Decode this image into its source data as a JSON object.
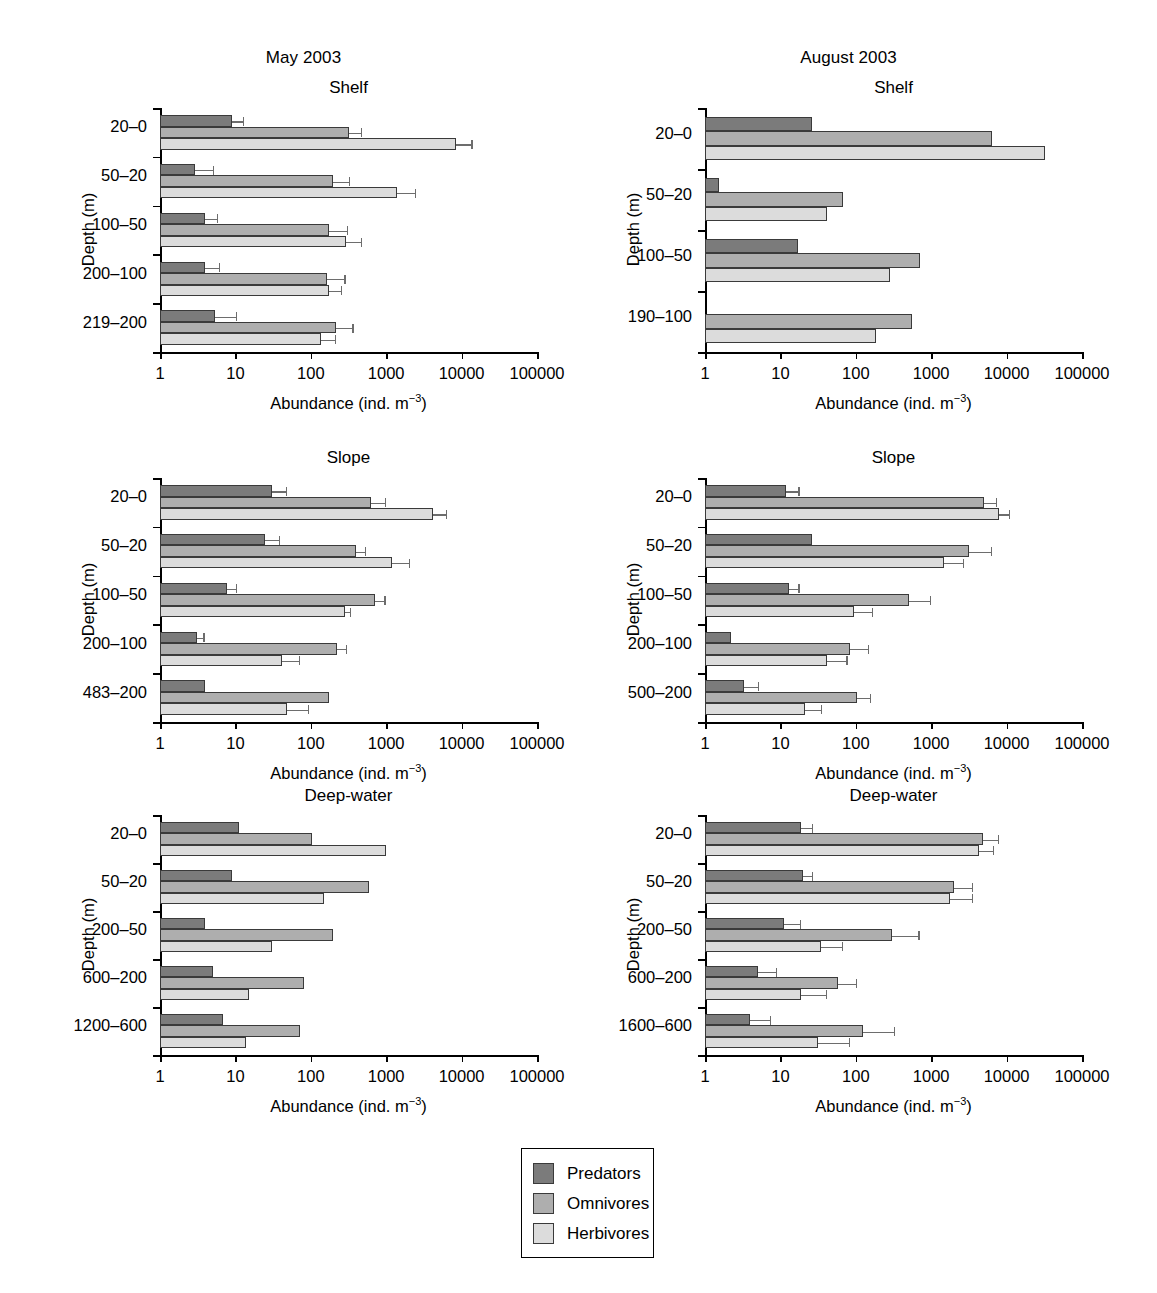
{
  "figure": {
    "columns": [
      {
        "id": "may",
        "title": "May 2003"
      },
      {
        "id": "august",
        "title": "August 2003"
      }
    ],
    "axis_title_x": "Abundance (ind. m",
    "axis_title_x_sup": "−3",
    "axis_title_x_close": ")",
    "axis_title_y": "Depth (m)",
    "xticks": [
      "1",
      "10",
      "100",
      "1000",
      "10000",
      "100000"
    ]
  },
  "legend": {
    "position": "bottom-center",
    "items": [
      {
        "label": "Predators",
        "color": "#7b7b7b"
      },
      {
        "label": "Omnivores",
        "color": "#aeaeae"
      },
      {
        "label": "Herbivores",
        "color": "#dcdcdc"
      }
    ]
  },
  "colors": {
    "predators": "#7b7b7b",
    "omnivores": "#aeaeae",
    "herbivores": "#dcdcdc",
    "axis": "#000000",
    "error": "#6d6d6d"
  },
  "chart_data": [
    {
      "id": "may-shelf",
      "type": "bar",
      "orientation": "horizontal",
      "title": "Shelf",
      "column": "May 2003",
      "xlabel": "Abundance (ind. m-3)",
      "ylabel": "Depth (m)",
      "xscale": "log",
      "xlim": [
        1,
        100000
      ],
      "xticks": [
        1,
        10,
        100,
        1000,
        10000,
        100000
      ],
      "grid": false,
      "categories": [
        "20–0",
        "50–20",
        "100–50",
        "200–100",
        "219–200"
      ],
      "series": [
        {
          "name": "Predators",
          "values": [
            9,
            2.9,
            3.9,
            3.9,
            5.4
          ],
          "errors_upper": [
            13,
            5.2,
            5.9,
            6.2,
            10.5
          ]
        },
        {
          "name": "Omnivores",
          "values": [
            320,
            200,
            175,
            165,
            215
          ],
          "errors_upper": [
            480,
            330,
            310,
            290,
            370
          ]
        },
        {
          "name": "Herbivores",
          "values": [
            8500,
            1400,
            290,
            175,
            135
          ],
          "errors_upper": [
            14000,
            2500,
            480,
            260,
            215
          ]
        }
      ]
    },
    {
      "id": "august-shelf",
      "type": "bar",
      "orientation": "horizontal",
      "title": "Shelf",
      "column": "August 2003",
      "xlabel": "Abundance (ind. m-3)",
      "ylabel": "Depth (m)",
      "xscale": "log",
      "xlim": [
        1,
        100000
      ],
      "xticks": [
        1,
        10,
        100,
        1000,
        10000,
        100000
      ],
      "grid": false,
      "categories": [
        "20–0",
        "50–20",
        "100–50",
        "190–100"
      ],
      "series": [
        {
          "name": "Predators",
          "values": [
            26,
            1.55,
            17,
            0
          ],
          "errors_upper": [
            0,
            0,
            0,
            0
          ]
        },
        {
          "name": "Omnivores",
          "values": [
            6500,
            68,
            720,
            560
          ],
          "errors_upper": [
            0,
            0,
            0,
            0
          ]
        },
        {
          "name": "Herbivores",
          "values": [
            32000,
            42,
            280,
            185
          ],
          "errors_upper": [
            0,
            0,
            0,
            0
          ]
        }
      ]
    },
    {
      "id": "may-slope",
      "type": "bar",
      "orientation": "horizontal",
      "title": "Slope",
      "column": "May 2003",
      "xlabel": "Abundance (ind. m-3)",
      "ylabel": "Depth (m)",
      "xscale": "log",
      "xlim": [
        1,
        100000
      ],
      "xticks": [
        1,
        10,
        100,
        1000,
        10000,
        100000
      ],
      "grid": false,
      "categories": [
        "20–0",
        "50–20",
        "100–50",
        "200–100",
        "483–200"
      ],
      "series": [
        {
          "name": "Predators",
          "values": [
            31,
            25,
            7.8,
            3.1,
            4.0
          ],
          "errors_upper": [
            48,
            39,
            10.5,
            3.9,
            0
          ]
        },
        {
          "name": "Omnivores",
          "values": [
            620,
            400,
            700,
            220,
            175
          ],
          "errors_upper": [
            1000,
            540,
            980,
            300,
            0
          ]
        },
        {
          "name": "Herbivores",
          "values": [
            4200,
            1200,
            280,
            42,
            48
          ],
          "errors_upper": [
            6500,
            2100,
            340,
            72,
            95
          ]
        }
      ]
    },
    {
      "id": "august-slope",
      "type": "bar",
      "orientation": "horizontal",
      "title": "Slope",
      "column": "August 2003",
      "xlabel": "Abundance (ind. m-3)",
      "ylabel": "Depth (m)",
      "xscale": "log",
      "xlim": [
        1,
        100000
      ],
      "xticks": [
        1,
        10,
        100,
        1000,
        10000,
        100000
      ],
      "grid": false,
      "categories": [
        "20–0",
        "50–20",
        "100–50",
        "200–100",
        "500–200"
      ],
      "series": [
        {
          "name": "Predators",
          "values": [
            12,
            26,
            13,
            2.2,
            3.3
          ],
          "errors_upper": [
            18,
            0,
            18,
            0,
            5.2
          ]
        },
        {
          "name": "Omnivores",
          "values": [
            5000,
            3200,
            500,
            85,
            105
          ],
          "errors_upper": [
            7500,
            6500,
            1000,
            150,
            160
          ]
        },
        {
          "name": "Herbivores",
          "values": [
            8000,
            1500,
            95,
            42,
            21
          ],
          "errors_upper": [
            11000,
            2700,
            170,
            78,
            36
          ]
        }
      ]
    },
    {
      "id": "may-deepwater",
      "type": "bar",
      "orientation": "horizontal",
      "title": "Deep-water",
      "column": "May 2003",
      "xlabel": "Abundance (ind. m-3)",
      "ylabel": "Depth (m)",
      "xscale": "log",
      "xlim": [
        1,
        100000
      ],
      "xticks": [
        1,
        10,
        100,
        1000,
        10000,
        100000
      ],
      "grid": false,
      "categories": [
        "20–0",
        "50–20",
        "200–50",
        "600–200",
        "1200–600"
      ],
      "series": [
        {
          "name": "Predators",
          "values": [
            11,
            9.0,
            4.0,
            5.1,
            6.8
          ],
          "errors_upper": [
            0,
            0,
            0,
            0,
            0
          ]
        },
        {
          "name": "Omnivores",
          "values": [
            105,
            600,
            195,
            82,
            72
          ],
          "errors_upper": [
            0,
            0,
            0,
            0,
            0
          ]
        },
        {
          "name": "Herbivores",
          "values": [
            1000,
            150,
            31,
            15,
            14
          ],
          "errors_upper": [
            0,
            0,
            0,
            0,
            0
          ]
        }
      ]
    },
    {
      "id": "august-deepwater",
      "type": "bar",
      "orientation": "horizontal",
      "title": "Deep-water",
      "column": "August 2003",
      "xlabel": "Abundance (ind. m-3)",
      "ylabel": "Depth (m)",
      "xscale": "log",
      "xlim": [
        1,
        100000
      ],
      "xticks": [
        1,
        10,
        100,
        1000,
        10000,
        100000
      ],
      "grid": false,
      "categories": [
        "20–0",
        "50–20",
        "200–50",
        "600–200",
        "1600–600"
      ],
      "series": [
        {
          "name": "Predators",
          "values": [
            19,
            20,
            11,
            5.0,
            4.0
          ],
          "errors_upper": [
            27,
            27,
            19,
            9.0,
            7.5
          ]
        },
        {
          "name": "Omnivores",
          "values": [
            4800,
            2000,
            300,
            58,
            125
          ],
          "errors_upper": [
            8000,
            3600,
            700,
            105,
            330
          ]
        },
        {
          "name": "Herbivores",
          "values": [
            4300,
            1800,
            35,
            19,
            32
          ],
          "errors_upper": [
            6800,
            3600,
            68,
            42,
            85
          ]
        }
      ]
    }
  ]
}
